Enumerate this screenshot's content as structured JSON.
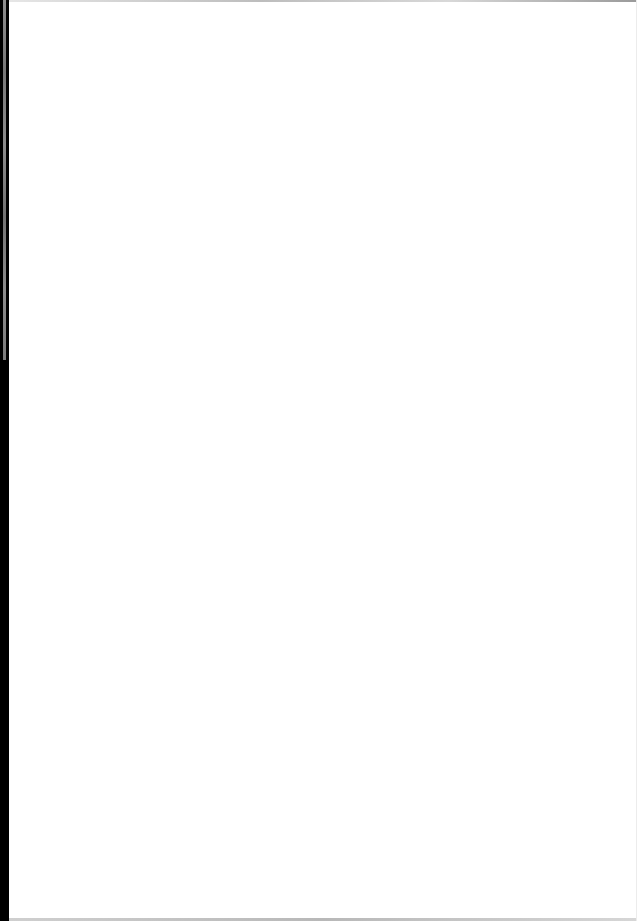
{
  "document": {
    "type": "scanned-page",
    "content": "",
    "colors": {
      "page_background": "#ffffff",
      "binding_edge": "#000000"
    }
  }
}
